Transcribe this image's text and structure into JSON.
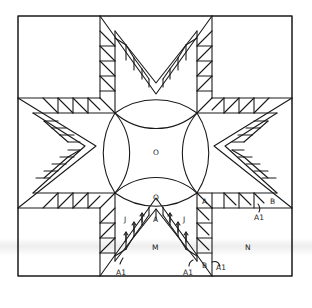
{
  "diagram": {
    "title": "",
    "type": "quilt-block-pattern",
    "labels": {
      "center": "O",
      "melon_bottom": "Q",
      "corner_triangle_left": "J",
      "corner_triangle_right": "J",
      "diamond_tip": "A",
      "half_square_A": "A",
      "bottom_triangle": "M",
      "corner_square": "N",
      "end_triangle_right": "B",
      "end_triangle_bottom": "B",
      "callout_left": "A1",
      "callout_mid": "A1",
      "callout_right_lower": "A1",
      "callout_right_upper": "A1"
    },
    "colors": {
      "line": "#1a1a1a",
      "background": "#ffffff"
    }
  }
}
